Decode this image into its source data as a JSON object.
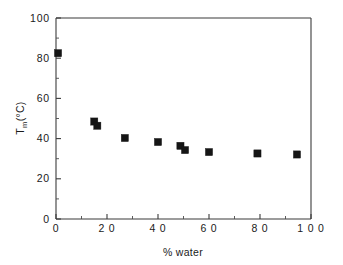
{
  "chart_data": {
    "type": "scatter",
    "title": "",
    "xlabel": "% water",
    "ylabel": "Tm(°C)",
    "ylabel_base": "T",
    "ylabel_sub": "m",
    "ylabel_tail": "(°C)",
    "xlim": [
      0,
      100
    ],
    "ylim": [
      0,
      100
    ],
    "grid": false,
    "legend": null,
    "marker_style": "filled-square",
    "marker_color": "#151515",
    "x_ticks": [
      0,
      20,
      40,
      60,
      80,
      100
    ],
    "x_tick_labels": [
      "0",
      "2 0",
      "4 0",
      "6 0",
      "8 0",
      "1 0 0"
    ],
    "x_minor_ticks": [
      10,
      30,
      50,
      70,
      90
    ],
    "y_ticks": [
      0,
      20,
      40,
      60,
      80,
      100
    ],
    "y_tick_labels": [
      "0",
      "20",
      "40",
      "60",
      "80",
      "100"
    ],
    "y_minor_ticks": [
      10,
      30,
      50,
      70,
      90
    ],
    "points": [
      {
        "x": 0.8,
        "y": 82.5
      },
      {
        "x": 15.0,
        "y": 48.5
      },
      {
        "x": 16.2,
        "y": 46.4
      },
      {
        "x": 27.0,
        "y": 40.3
      },
      {
        "x": 40.0,
        "y": 38.3
      },
      {
        "x": 48.8,
        "y": 36.4
      },
      {
        "x": 50.6,
        "y": 34.3
      },
      {
        "x": 60.0,
        "y": 33.3
      },
      {
        "x": 79.0,
        "y": 32.6
      },
      {
        "x": 94.5,
        "y": 32.1
      }
    ],
    "axes": {
      "left_px": 56,
      "right_px": 311,
      "top_px": 18,
      "bottom_px": 219
    }
  }
}
